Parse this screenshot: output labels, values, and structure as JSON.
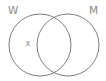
{
  "diagram": {
    "type": "venn",
    "sets": [
      {
        "label": "W",
        "cx": 40,
        "cy": 45,
        "r": 31
      },
      {
        "label": "M",
        "cx": 68,
        "cy": 45,
        "r": 31
      }
    ],
    "marks": [
      {
        "label": "x",
        "region": "W only",
        "x": 28,
        "y": 45
      }
    ],
    "colors": {
      "stroke": "#707070",
      "text": "#8a8a8a",
      "background": "#ffffff"
    }
  }
}
